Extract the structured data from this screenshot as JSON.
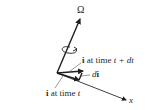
{
  "figure": {
    "omega_label": "Ω",
    "x_label": "x",
    "i_t_plus_dt": {
      "vec": "i",
      "text": " at time ",
      "var": "t + dt"
    },
    "di": {
      "d": "d",
      "vec": "i"
    },
    "i_t": {
      "vec": "i",
      "text": " at time ",
      "var": "t"
    },
    "colors": {
      "ink": "#2a2a2a",
      "background": "#ffffff"
    }
  }
}
